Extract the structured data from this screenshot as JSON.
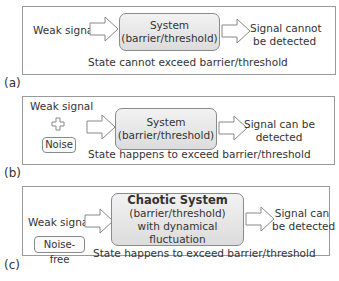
{
  "panels": [
    {
      "label": "(a)",
      "input": "Weak signal",
      "system": [
        "System",
        "(barrier/threshold)"
      ],
      "output": [
        "Signal cannot",
        "be  detected"
      ],
      "caption": "State cannot exceed barrier/threshold"
    },
    {
      "label": "(b)",
      "input": "Weak signal",
      "plus": "plus-symbol",
      "extra": "Noise",
      "system": [
        "System",
        "(barrier/threshold)"
      ],
      "output": [
        "Signal can be",
        "detected"
      ],
      "caption": "State happens to exceed barrier/threshold"
    },
    {
      "label": "(c)",
      "input": "Weak signal",
      "extra": "Noise-free",
      "system": [
        "Chaotic System",
        "(barrier/threshold)",
        "with dynamical fluctuation"
      ],
      "output": [
        "Signal can",
        "be detected"
      ],
      "caption": "State happens to exceed barrier/threshold"
    }
  ],
  "colors": {
    "border": "#9a9a9a",
    "system_fill_top": "#f2f2f2",
    "system_fill_bottom": "#dcdcdc",
    "text": "#333333"
  }
}
